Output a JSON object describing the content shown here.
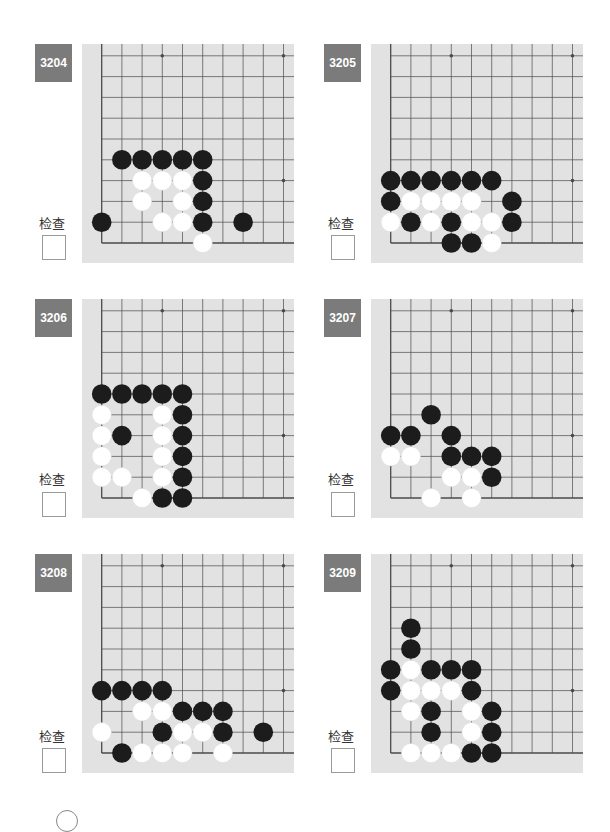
{
  "page": {
    "check_label": "检查",
    "colors": {
      "label_bg": "#7b7b7b",
      "board_bg": "#e2e2e2",
      "grid_line": "#4a4a4a",
      "black_stone": "#1c1c1c",
      "white_stone": "#ffffff"
    }
  },
  "board_spec": {
    "columns": 10,
    "rows": 10,
    "corner": "bottom-left",
    "star_points": [
      [
        3,
        9
      ],
      [
        9,
        9
      ],
      [
        9,
        3
      ]
    ]
  },
  "problems": [
    {
      "number": "3204",
      "black": [
        [
          1,
          4
        ],
        [
          2,
          4
        ],
        [
          3,
          4
        ],
        [
          4,
          4
        ],
        [
          5,
          4
        ],
        [
          5,
          3
        ],
        [
          5,
          2
        ],
        [
          0,
          1
        ],
        [
          5,
          1
        ],
        [
          7,
          1
        ]
      ],
      "white": [
        [
          2,
          3
        ],
        [
          3,
          3
        ],
        [
          4,
          3
        ],
        [
          2,
          2
        ],
        [
          4,
          2
        ],
        [
          3,
          1
        ],
        [
          4,
          1
        ],
        [
          5,
          0
        ]
      ]
    },
    {
      "number": "3205",
      "black": [
        [
          0,
          3
        ],
        [
          1,
          3
        ],
        [
          2,
          3
        ],
        [
          3,
          3
        ],
        [
          4,
          3
        ],
        [
          5,
          3
        ],
        [
          0,
          2
        ],
        [
          6,
          2
        ],
        [
          1,
          1
        ],
        [
          3,
          1
        ],
        [
          6,
          1
        ],
        [
          3,
          0
        ],
        [
          4,
          0
        ]
      ],
      "white": [
        [
          1,
          2
        ],
        [
          2,
          2
        ],
        [
          3,
          2
        ],
        [
          4,
          2
        ],
        [
          0,
          1
        ],
        [
          2,
          1
        ],
        [
          4,
          1
        ],
        [
          5,
          1
        ],
        [
          5,
          0
        ]
      ]
    },
    {
      "number": "3206",
      "black": [
        [
          0,
          5
        ],
        [
          1,
          5
        ],
        [
          2,
          5
        ],
        [
          3,
          5
        ],
        [
          4,
          5
        ],
        [
          4,
          4
        ],
        [
          1,
          3
        ],
        [
          4,
          3
        ],
        [
          4,
          2
        ],
        [
          4,
          1
        ],
        [
          3,
          0
        ],
        [
          4,
          0
        ]
      ],
      "white": [
        [
          0,
          4
        ],
        [
          3,
          4
        ],
        [
          0,
          3
        ],
        [
          3,
          3
        ],
        [
          0,
          2
        ],
        [
          3,
          2
        ],
        [
          0,
          1
        ],
        [
          1,
          1
        ],
        [
          3,
          1
        ],
        [
          2,
          0
        ]
      ]
    },
    {
      "number": "3207",
      "black": [
        [
          2,
          4
        ],
        [
          0,
          3
        ],
        [
          1,
          3
        ],
        [
          3,
          3
        ],
        [
          3,
          2
        ],
        [
          4,
          2
        ],
        [
          5,
          2
        ],
        [
          5,
          1
        ]
      ],
      "white": [
        [
          0,
          2
        ],
        [
          1,
          2
        ],
        [
          3,
          1
        ],
        [
          4,
          1
        ],
        [
          2,
          0
        ],
        [
          4,
          0
        ]
      ]
    },
    {
      "number": "3208",
      "black": [
        [
          0,
          3
        ],
        [
          1,
          3
        ],
        [
          2,
          3
        ],
        [
          3,
          3
        ],
        [
          4,
          2
        ],
        [
          5,
          2
        ],
        [
          6,
          2
        ],
        [
          3,
          1
        ],
        [
          6,
          1
        ],
        [
          8,
          1
        ],
        [
          1,
          0
        ]
      ],
      "white": [
        [
          2,
          2
        ],
        [
          3,
          2
        ],
        [
          0,
          1
        ],
        [
          4,
          1
        ],
        [
          5,
          1
        ],
        [
          2,
          0
        ],
        [
          3,
          0
        ],
        [
          4,
          0
        ],
        [
          6,
          0
        ]
      ]
    },
    {
      "number": "3209",
      "black": [
        [
          1,
          6
        ],
        [
          1,
          5
        ],
        [
          0,
          4
        ],
        [
          2,
          4
        ],
        [
          3,
          4
        ],
        [
          4,
          4
        ],
        [
          0,
          3
        ],
        [
          4,
          3
        ],
        [
          2,
          2
        ],
        [
          5,
          2
        ],
        [
          2,
          1
        ],
        [
          5,
          1
        ],
        [
          4,
          0
        ],
        [
          5,
          0
        ]
      ],
      "white": [
        [
          1,
          4
        ],
        [
          1,
          3
        ],
        [
          2,
          3
        ],
        [
          3,
          3
        ],
        [
          1,
          2
        ],
        [
          4,
          2
        ],
        [
          4,
          1
        ],
        [
          1,
          0
        ],
        [
          2,
          0
        ],
        [
          3,
          0
        ]
      ]
    }
  ]
}
